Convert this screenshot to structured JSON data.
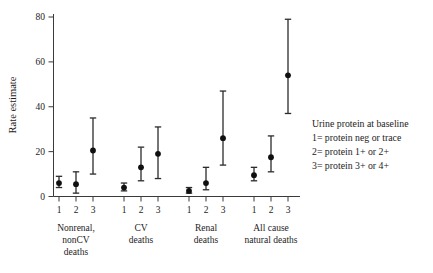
{
  "chart_data": {
    "type": "scatter",
    "title": "",
    "xlabel": "",
    "ylabel": "Rate estimate",
    "ylim": [
      0,
      85
    ],
    "yticks": [
      0,
      20,
      40,
      60,
      80
    ],
    "grid": false,
    "legend_position": "right-middle",
    "error_bars": "confidence interval",
    "categories": [
      "1",
      "2",
      "3"
    ],
    "groups": [
      {
        "name": "Nonrenal, nonCV deaths",
        "label_lines": [
          "Nonrenal,",
          "nonCV",
          "deaths"
        ],
        "points": [
          {
            "x": "1",
            "value": 6.0,
            "low": 4.0,
            "high": 9.0
          },
          {
            "x": "2",
            "value": 5.5,
            "low": 1.5,
            "high": 11.0
          },
          {
            "x": "3",
            "value": 20.5,
            "low": 10.0,
            "high": 35.0
          }
        ]
      },
      {
        "name": "CV deaths",
        "label_lines": [
          "CV",
          "deaths"
        ],
        "points": [
          {
            "x": "1",
            "value": 4.0,
            "low": 2.5,
            "high": 6.0
          },
          {
            "x": "2",
            "value": 13.0,
            "low": 7.0,
            "high": 22.0
          },
          {
            "x": "3",
            "value": 19.0,
            "low": 8.0,
            "high": 31.0
          }
        ]
      },
      {
        "name": "Renal deaths",
        "label_lines": [
          "Renal",
          "deaths"
        ],
        "points": [
          {
            "x": "1",
            "value": 2.5,
            "low": 1.5,
            "high": 4.0
          },
          {
            "x": "2",
            "value": 6.0,
            "low": 3.0,
            "high": 13.0
          },
          {
            "x": "3",
            "value": 26.0,
            "low": 14.0,
            "high": 47.0
          }
        ]
      },
      {
        "name": "All cause natural deaths",
        "label_lines": [
          "All cause",
          "natural deaths"
        ],
        "points": [
          {
            "x": "1",
            "value": 9.5,
            "low": 7.0,
            "high": 13.0
          },
          {
            "x": "2",
            "value": 17.5,
            "low": 11.0,
            "high": 27.0
          },
          {
            "x": "3",
            "value": 54.0,
            "low": 37.0,
            "high": 79.0
          }
        ]
      }
    ]
  },
  "legend": {
    "title": "Urine protein at baseline",
    "entries": [
      "1= protein neg or trace",
      "2= protein 1+ or  2+",
      "3= protein 3+ or  4+"
    ]
  },
  "colors": {
    "marker": "#101010",
    "error_bar": "#2b2b2b",
    "axis": "#3a3a3a",
    "text": "#1c1c1c",
    "background": "#ffffff"
  }
}
